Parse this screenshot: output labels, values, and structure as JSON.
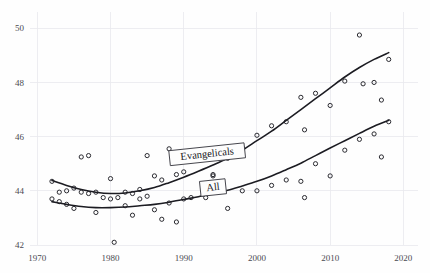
{
  "chart_data": {
    "type": "scatter",
    "title": "",
    "subtitle": "",
    "xlabel": "",
    "ylabel": "",
    "xlim": [
      1969,
      2022
    ],
    "ylim": [
      42,
      50.6
    ],
    "xticks": [
      1970,
      1980,
      1990,
      2000,
      2010,
      2020
    ],
    "xtick_labels": [
      "1970",
      "1980",
      "1990",
      "2000",
      "2010",
      "2020"
    ],
    "yticks": [
      42,
      44,
      46,
      48,
      50
    ],
    "ytick_labels": [
      "42",
      "44",
      "46",
      "48",
      "50"
    ],
    "grid": true,
    "legend_position": "inline-callout",
    "marker": "open-circle",
    "series": [
      {
        "name": "Evangelicals",
        "label": "Evangelicals",
        "points": [
          {
            "x": 1972,
            "y": 44.35
          },
          {
            "x": 1973,
            "y": 43.95
          },
          {
            "x": 1974,
            "y": 44.0
          },
          {
            "x": 1975,
            "y": 44.1
          },
          {
            "x": 1976,
            "y": 45.25
          },
          {
            "x": 1977,
            "y": 45.3
          },
          {
            "x": 1978,
            "y": 43.95
          },
          {
            "x": 1980,
            "y": 44.45
          },
          {
            "x": 1982,
            "y": 43.95
          },
          {
            "x": 1983,
            "y": 43.9
          },
          {
            "x": 1984,
            "y": 44.05
          },
          {
            "x": 1985,
            "y": 45.3
          },
          {
            "x": 1986,
            "y": 44.55
          },
          {
            "x": 1987,
            "y": 44.4
          },
          {
            "x": 1988,
            "y": 45.55
          },
          {
            "x": 1989,
            "y": 44.6
          },
          {
            "x": 1990,
            "y": 44.7
          },
          {
            "x": 1991,
            "y": 45.3
          },
          {
            "x": 1993,
            "y": 45.5
          },
          {
            "x": 1994,
            "y": 44.55
          },
          {
            "x": 1996,
            "y": 45.2
          },
          {
            "x": 1998,
            "y": 45.6
          },
          {
            "x": 2000,
            "y": 46.05
          },
          {
            "x": 2002,
            "y": 46.4
          },
          {
            "x": 2004,
            "y": 46.55
          },
          {
            "x": 2006,
            "y": 47.45
          },
          {
            "x": 2006.5,
            "y": 46.25
          },
          {
            "x": 2008,
            "y": 47.6
          },
          {
            "x": 2010,
            "y": 47.15
          },
          {
            "x": 2012,
            "y": 48.05
          },
          {
            "x": 2014,
            "y": 49.75
          },
          {
            "x": 2014.5,
            "y": 47.95
          },
          {
            "x": 2016,
            "y": 48.0
          },
          {
            "x": 2017,
            "y": 47.35
          },
          {
            "x": 2018,
            "y": 48.85
          }
        ],
        "trend": [
          {
            "x": 1972,
            "y": 44.38
          },
          {
            "x": 1974,
            "y": 44.2
          },
          {
            "x": 1976,
            "y": 44.05
          },
          {
            "x": 1978,
            "y": 43.95
          },
          {
            "x": 1980,
            "y": 43.9
          },
          {
            "x": 1982,
            "y": 43.92
          },
          {
            "x": 1984,
            "y": 44.0
          },
          {
            "x": 1986,
            "y": 44.12
          },
          {
            "x": 1988,
            "y": 44.3
          },
          {
            "x": 1990,
            "y": 44.5
          },
          {
            "x": 1992,
            "y": 44.72
          },
          {
            "x": 1994,
            "y": 44.95
          },
          {
            "x": 1996,
            "y": 45.2
          },
          {
            "x": 1998,
            "y": 45.5
          },
          {
            "x": 2000,
            "y": 45.85
          },
          {
            "x": 2002,
            "y": 46.2
          },
          {
            "x": 2004,
            "y": 46.6
          },
          {
            "x": 2006,
            "y": 47.0
          },
          {
            "x": 2008,
            "y": 47.4
          },
          {
            "x": 2010,
            "y": 47.8
          },
          {
            "x": 2012,
            "y": 48.2
          },
          {
            "x": 2014,
            "y": 48.55
          },
          {
            "x": 2016,
            "y": 48.85
          },
          {
            "x": 2018,
            "y": 49.1
          }
        ]
      },
      {
        "name": "All",
        "label": "All",
        "points": [
          {
            "x": 1972,
            "y": 43.7
          },
          {
            "x": 1973,
            "y": 43.6
          },
          {
            "x": 1974,
            "y": 43.5
          },
          {
            "x": 1975,
            "y": 43.35
          },
          {
            "x": 1976,
            "y": 43.95
          },
          {
            "x": 1977,
            "y": 43.9
          },
          {
            "x": 1978,
            "y": 43.2
          },
          {
            "x": 1979,
            "y": 43.75
          },
          {
            "x": 1980,
            "y": 43.7
          },
          {
            "x": 1980.5,
            "y": 42.1
          },
          {
            "x": 1981,
            "y": 43.75
          },
          {
            "x": 1982,
            "y": 43.45
          },
          {
            "x": 1983,
            "y": 43.1
          },
          {
            "x": 1984,
            "y": 43.7
          },
          {
            "x": 1985,
            "y": 43.8
          },
          {
            "x": 1986,
            "y": 43.3
          },
          {
            "x": 1987,
            "y": 42.95
          },
          {
            "x": 1988,
            "y": 43.55
          },
          {
            "x": 1989,
            "y": 42.85
          },
          {
            "x": 1990,
            "y": 43.7
          },
          {
            "x": 1991,
            "y": 43.75
          },
          {
            "x": 1993,
            "y": 43.75
          },
          {
            "x": 1994,
            "y": 44.6
          },
          {
            "x": 1996,
            "y": 43.35
          },
          {
            "x": 1998,
            "y": 44.0
          },
          {
            "x": 2000,
            "y": 44.0
          },
          {
            "x": 2002,
            "y": 44.2
          },
          {
            "x": 2004,
            "y": 44.4
          },
          {
            "x": 2006,
            "y": 44.35
          },
          {
            "x": 2006.5,
            "y": 43.75
          },
          {
            "x": 2008,
            "y": 45.0
          },
          {
            "x": 2010,
            "y": 44.55
          },
          {
            "x": 2012,
            "y": 45.5
          },
          {
            "x": 2014,
            "y": 45.9
          },
          {
            "x": 2016,
            "y": 46.1
          },
          {
            "x": 2017,
            "y": 45.25
          },
          {
            "x": 2018,
            "y": 46.55
          }
        ],
        "trend": [
          {
            "x": 1972,
            "y": 43.6
          },
          {
            "x": 1974,
            "y": 43.5
          },
          {
            "x": 1976,
            "y": 43.42
          },
          {
            "x": 1978,
            "y": 43.38
          },
          {
            "x": 1980,
            "y": 43.38
          },
          {
            "x": 1982,
            "y": 43.4
          },
          {
            "x": 1984,
            "y": 43.45
          },
          {
            "x": 1986,
            "y": 43.5
          },
          {
            "x": 1988,
            "y": 43.58
          },
          {
            "x": 1990,
            "y": 43.68
          },
          {
            "x": 1992,
            "y": 43.78
          },
          {
            "x": 1994,
            "y": 43.9
          },
          {
            "x": 1996,
            "y": 44.02
          },
          {
            "x": 1998,
            "y": 44.18
          },
          {
            "x": 2000,
            "y": 44.35
          },
          {
            "x": 2002,
            "y": 44.55
          },
          {
            "x": 2004,
            "y": 44.78
          },
          {
            "x": 2006,
            "y": 45.02
          },
          {
            "x": 2008,
            "y": 45.3
          },
          {
            "x": 2010,
            "y": 45.58
          },
          {
            "x": 2012,
            "y": 45.85
          },
          {
            "x": 2014,
            "y": 46.12
          },
          {
            "x": 2016,
            "y": 46.38
          },
          {
            "x": 2018,
            "y": 46.6
          }
        ]
      }
    ],
    "annotations": [
      {
        "name": "evangelicals-callout",
        "text": "Evangelicals",
        "x": 1993.2,
        "y": 45.35,
        "rotation": -6
      },
      {
        "name": "all-callout",
        "text": "All",
        "x": 1994.0,
        "y": 44.12,
        "rotation": -6
      }
    ],
    "colors": {
      "background": "#fefefe",
      "grid": "#e9e9ee",
      "marker_stroke": "#2a2a30",
      "trend_stroke": "#1c1c22",
      "tick_text": "#4a4a52",
      "callout_stroke": "#3a3a42",
      "callout_fill": "#fdfdfd"
    }
  }
}
